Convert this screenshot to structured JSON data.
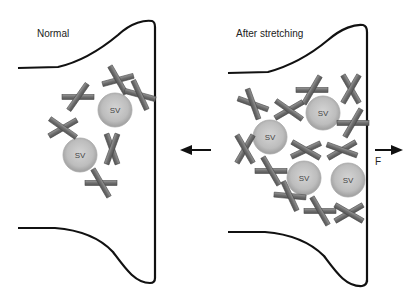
{
  "panels": [
    {
      "title": "Normal",
      "vesicle_label": "SV",
      "vesicles": [
        {
          "x": 115,
          "y": 110
        },
        {
          "x": 80,
          "y": 155
        }
      ],
      "crosses": [
        {
          "x": 118,
          "y": 80,
          "a": -15,
          "b": 60
        },
        {
          "x": 78,
          "y": 97,
          "a": 0,
          "b": -55
        },
        {
          "x": 140,
          "y": 95,
          "a": 15,
          "b": 65
        },
        {
          "x": 63,
          "y": 128,
          "a": -30,
          "b": 35
        },
        {
          "x": 112,
          "y": 149,
          "a": 70,
          "b": -70
        },
        {
          "x": 101,
          "y": 183,
          "a": 0,
          "b": 60
        }
      ]
    },
    {
      "title": "After stretching",
      "vesicle_label": "SV",
      "vesicles": [
        {
          "x": 323,
          "y": 113
        },
        {
          "x": 270,
          "y": 137
        },
        {
          "x": 304,
          "y": 178
        },
        {
          "x": 348,
          "y": 180
        }
      ],
      "crosses": [
        {
          "x": 312,
          "y": 90,
          "a": 0,
          "b": -60
        },
        {
          "x": 351,
          "y": 89,
          "a": 60,
          "b": -60
        },
        {
          "x": 253,
          "y": 104,
          "a": 20,
          "b": 70
        },
        {
          "x": 289,
          "y": 110,
          "a": -30,
          "b": 35
        },
        {
          "x": 353,
          "y": 123,
          "a": 0,
          "b": -60
        },
        {
          "x": 245,
          "y": 149,
          "a": -60,
          "b": 60
        },
        {
          "x": 306,
          "y": 150,
          "a": -25,
          "b": 30
        },
        {
          "x": 342,
          "y": 150,
          "a": -30,
          "b": 20
        },
        {
          "x": 271,
          "y": 171,
          "a": 0,
          "b": 60
        },
        {
          "x": 290,
          "y": 196,
          "a": 5,
          "b": 65
        },
        {
          "x": 320,
          "y": 211,
          "a": 0,
          "b": 60
        },
        {
          "x": 349,
          "y": 213,
          "a": -30,
          "b": 30
        }
      ]
    }
  ],
  "arrows": {
    "left": {
      "direction": "left"
    },
    "right": {
      "direction": "right",
      "label": "F"
    }
  }
}
